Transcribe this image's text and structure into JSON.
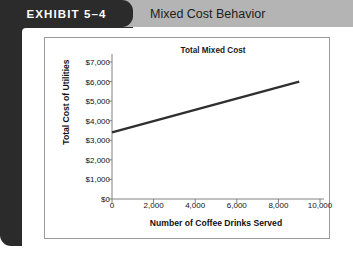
{
  "header": {
    "exhibit_label": "EXHIBIT 5–4",
    "title": "Mixed Cost Behavior",
    "tab_bg": "#2b2b2b",
    "band_bg": "#b4b4b4"
  },
  "chart_data": {
    "type": "line",
    "title": "Total Mixed Cost",
    "xlabel": "Number of Coffee Drinks Served",
    "ylabel": "Total Cost of Utilities",
    "x": [
      0,
      9000
    ],
    "values": [
      3400,
      6000
    ],
    "xlim": [
      0,
      10000
    ],
    "ylim": [
      0,
      7000
    ],
    "xticks": [
      0,
      2000,
      4000,
      6000,
      8000,
      10000
    ],
    "xtick_labels": [
      "0",
      "2,000",
      "4,000",
      "6,000",
      "8,000",
      "10,000"
    ],
    "yticks": [
      0,
      1000,
      2000,
      3000,
      4000,
      5000,
      6000,
      7000
    ],
    "ytick_labels": [
      "$0",
      "$1,000",
      "$2,000",
      "$3,000",
      "$4,000",
      "$5,000",
      "$6,000",
      "$7,000"
    ],
    "grid": false,
    "legend": null,
    "line_color": "#2f2f2f",
    "axis_color": "#808080"
  }
}
